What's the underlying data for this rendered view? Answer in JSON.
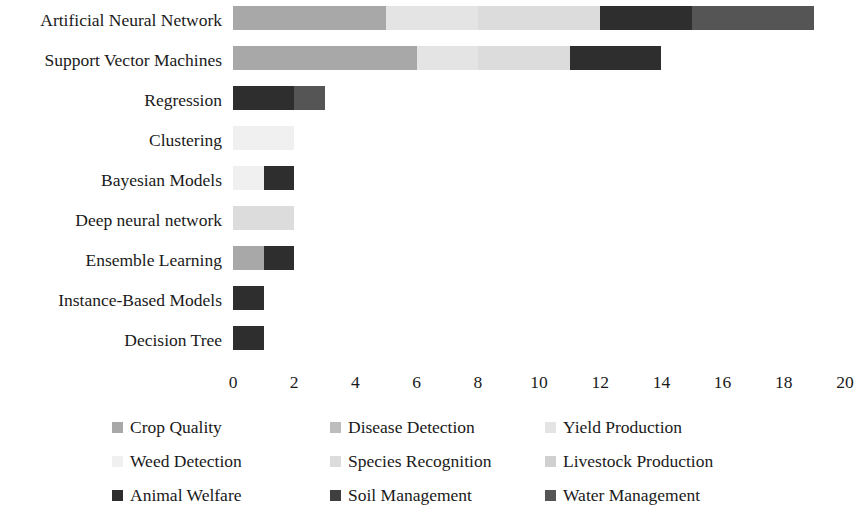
{
  "chart_data": {
    "type": "bar",
    "orientation": "horizontal",
    "stacked": true,
    "title": "",
    "xlabel": "",
    "ylabel": "",
    "xlim": [
      0,
      20
    ],
    "xticks": [
      0,
      2,
      4,
      6,
      8,
      10,
      12,
      14,
      16,
      18,
      20
    ],
    "xtick_labels": [
      "0",
      "2",
      "4",
      "6",
      "8",
      "10",
      "12",
      "14",
      "16",
      "18",
      "20"
    ],
    "grid": false,
    "legend_position": "bottom",
    "categories": [
      "Artificial Neural Network",
      "Support Vector Machines",
      "Regression",
      "Clustering",
      "Bayesian Models",
      "Deep neural network",
      "Ensemble Learning",
      "Instance-Based Models",
      "Decision Tree"
    ],
    "series": [
      {
        "name": "Crop Quality",
        "color": "#a8a8a8",
        "values": [
          5,
          6,
          0,
          0,
          0,
          0,
          1,
          0,
          0
        ]
      },
      {
        "name": "Disease Detection",
        "color": "#bdbdbd",
        "values": [
          0,
          0,
          0,
          0,
          0,
          0,
          0,
          0,
          0
        ]
      },
      {
        "name": "Yield Production",
        "color": "#e4e4e4",
        "values": [
          3,
          2,
          0,
          0,
          0,
          0,
          0,
          0,
          0
        ]
      },
      {
        "name": "Weed Detection",
        "color": "#f0f0f0",
        "values": [
          0,
          0,
          0,
          2,
          1,
          0,
          0,
          0,
          0
        ]
      },
      {
        "name": "Species Recognition",
        "color": "#dcdcdc",
        "values": [
          4,
          3,
          0,
          0,
          0,
          2,
          0,
          0,
          0
        ]
      },
      {
        "name": "Livestock Production",
        "color": "#d0d0d0",
        "values": [
          0,
          0,
          0,
          0,
          0,
          0,
          0,
          0,
          0
        ]
      },
      {
        "name": "Animal Welfare",
        "color": "#2e2e2e",
        "values": [
          3,
          3,
          2,
          0,
          1,
          0,
          1,
          1,
          1
        ]
      },
      {
        "name": "Soil Management",
        "color": "#3f3f3f",
        "values": [
          0,
          0,
          0,
          0,
          0,
          0,
          0,
          0,
          0
        ]
      },
      {
        "name": "Water Management",
        "color": "#555555",
        "values": [
          4,
          0,
          1,
          0,
          0,
          0,
          0,
          0,
          0
        ]
      }
    ],
    "totals": [
      19,
      14,
      3,
      2,
      2,
      2,
      2,
      1,
      1
    ]
  },
  "legend": {
    "rows": [
      [
        "Crop Quality",
        "Disease Detection",
        "Yield Production"
      ],
      [
        "Weed Detection",
        "Species Recognition",
        "Livestock Production"
      ],
      [
        "Animal Welfare",
        "Soil Management",
        "Water Management"
      ]
    ]
  }
}
